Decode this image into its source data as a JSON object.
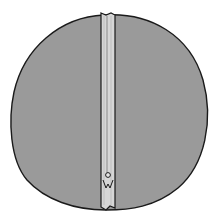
{
  "illustration": {
    "subject": "round cushion with zipper",
    "colors": {
      "background": "#ffffff",
      "fabric": "#9a9a9a",
      "outline": "#1a1a1a",
      "zipper_tape": "#d6d6d6",
      "zipper_teeth": "#bdbdbd"
    }
  }
}
